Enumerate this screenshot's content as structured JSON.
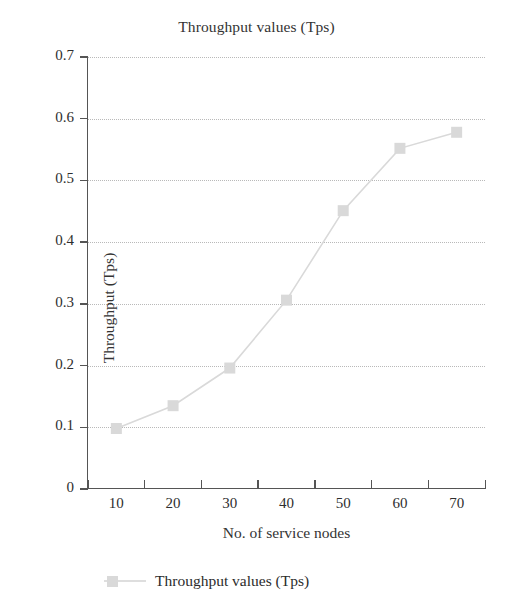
{
  "chart_data": {
    "type": "line",
    "title": "Throughput values (Tps)",
    "xlabel": "No. of service nodes",
    "ylabel": "Throughput (Tps)",
    "x": [
      10,
      20,
      30,
      40,
      50,
      60,
      70
    ],
    "categories": [
      "10",
      "20",
      "30",
      "40",
      "50",
      "60",
      "70"
    ],
    "series": [
      {
        "name": "Throughput values (Tps)",
        "values": [
          0.098,
          0.135,
          0.196,
          0.306,
          0.451,
          0.552,
          0.578
        ],
        "color": "#d9d9d9",
        "marker": "square"
      }
    ],
    "xlim": [
      5,
      75
    ],
    "ylim": [
      0,
      0.7
    ],
    "y_ticks": [
      "0.7",
      "0.6",
      "0.5",
      "0.4",
      "0.3",
      "0.2",
      "0.1",
      "0"
    ],
    "y_tick_values": [
      0.7,
      0.6,
      0.5,
      0.4,
      0.3,
      0.2,
      0.1,
      0
    ],
    "x_ticks": [
      "10",
      "20",
      "30",
      "40",
      "50",
      "60",
      "70"
    ],
    "grid": "horizontal-dotted",
    "legend_position": "bottom-left",
    "legend_entries": [
      "Throughput values (Tps)"
    ]
  },
  "colors": {
    "series": "#d9d9d9",
    "axis": "#555555",
    "grid": "#b9b9b9",
    "text": "#2b2b2b",
    "background": "#ffffff"
  }
}
